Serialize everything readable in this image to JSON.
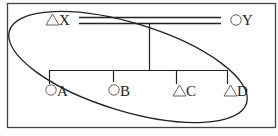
{
  "diagram": {
    "type": "pedigree",
    "parents": [
      {
        "id": "X",
        "symbol": "△",
        "label": "X",
        "shape": "triangle"
      },
      {
        "id": "Y",
        "symbol": "○",
        "label": "Y",
        "shape": "circle"
      }
    ],
    "marriage_line": "double",
    "children": [
      {
        "id": "A",
        "symbol": "○",
        "label": "A",
        "shape": "circle"
      },
      {
        "id": "B",
        "symbol": "○",
        "label": "B",
        "shape": "circle"
      },
      {
        "id": "C",
        "symbol": "△",
        "label": "C",
        "shape": "triangle"
      },
      {
        "id": "D",
        "symbol": "△",
        "label": "D",
        "shape": "triangle"
      }
    ],
    "ellipse_encloses": [
      "X",
      "A",
      "B",
      "C",
      "D"
    ]
  },
  "colors": {
    "line": "#222222",
    "symbol": "#666666",
    "frame": "#444444"
  }
}
